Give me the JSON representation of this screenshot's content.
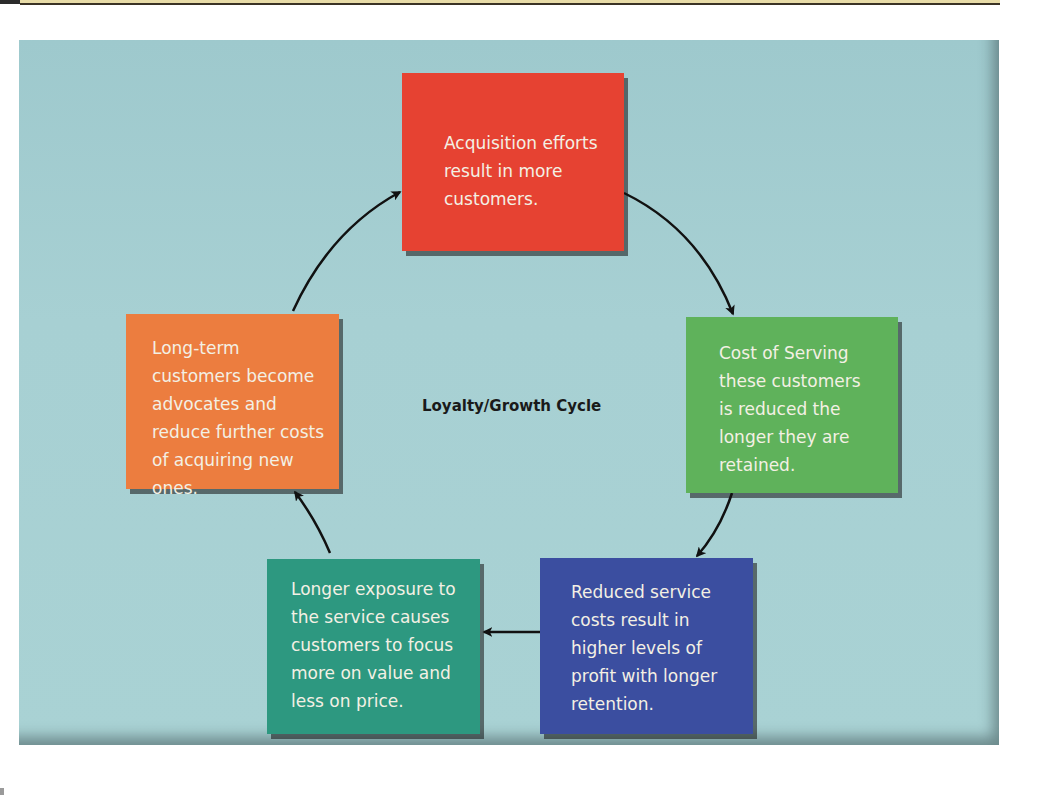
{
  "diagram": {
    "title": "Loyalty/Growth Cycle",
    "type": "cycle",
    "nodes": [
      {
        "id": "acquisition",
        "color": "#e64232",
        "text": [
          "Acquisition efforts",
          "result in more",
          "customers."
        ]
      },
      {
        "id": "cost-of-serving",
        "color": "#5fb25b",
        "text": [
          "Cost of Serving",
          "these customers",
          "is reduced the",
          "longer they are",
          "retained."
        ]
      },
      {
        "id": "reduced-costs",
        "color": "#3b4ea0",
        "text": [
          "Reduced service",
          "costs result in",
          "higher levels of",
          "profit with longer",
          "retention."
        ]
      },
      {
        "id": "longer-exposure",
        "color": "#2d9880",
        "text": [
          "Longer exposure to",
          "the service causes",
          "customers to focus",
          "more on value and",
          "less on price."
        ]
      },
      {
        "id": "advocates",
        "color": "#ec7d3f",
        "text": [
          "Long-term",
          "customers become",
          "advocates and",
          "reduce further costs",
          "of acquiring new ones."
        ]
      }
    ],
    "edges": [
      {
        "from": "acquisition",
        "to": "cost-of-serving"
      },
      {
        "from": "cost-of-serving",
        "to": "reduced-costs"
      },
      {
        "from": "reduced-costs",
        "to": "longer-exposure"
      },
      {
        "from": "longer-exposure",
        "to": "advocates"
      },
      {
        "from": "advocates",
        "to": "acquisition"
      }
    ],
    "background_color": "#a6cfd2"
  }
}
